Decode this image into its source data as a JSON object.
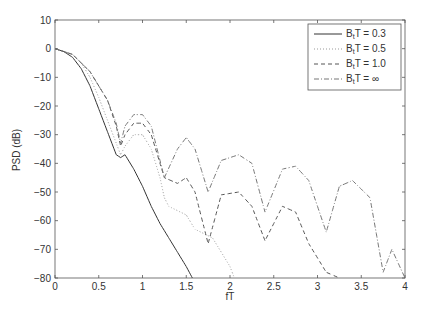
{
  "chart_data": {
    "type": "line",
    "title": "",
    "xlabel": "fT",
    "ylabel": "PSD (dB)",
    "xlim": [
      0,
      4
    ],
    "ylim": [
      -80,
      10
    ],
    "xticks": [
      "0",
      "0.5",
      "1",
      "1.5",
      "2",
      "2.5",
      "3",
      "3.5",
      "4"
    ],
    "yticks": [
      "10",
      "0",
      "-10",
      "-20",
      "-30",
      "-40",
      "-50",
      "-60",
      "-70",
      "-80"
    ],
    "grid": false,
    "legend_position": "upper right",
    "series": [
      {
        "name": "B_tT = 0.3",
        "style": "solid",
        "x": [
          0,
          0.1,
          0.2,
          0.3,
          0.4,
          0.5,
          0.6,
          0.7,
          0.75,
          0.8,
          0.9,
          1.0,
          1.1,
          1.2,
          1.3,
          1.4,
          1.5,
          1.57
        ],
        "y": [
          0,
          -1,
          -3,
          -7,
          -13,
          -21,
          -29,
          -37,
          -38,
          -37,
          -42,
          -48,
          -55,
          -61,
          -66,
          -71,
          -76,
          -80
        ]
      },
      {
        "name": "B_tT = 0.5",
        "style": "dotted",
        "x": [
          0,
          0.1,
          0.2,
          0.3,
          0.4,
          0.5,
          0.6,
          0.7,
          0.75,
          0.8,
          0.9,
          1.0,
          1.1,
          1.2,
          1.25,
          1.3,
          1.5,
          1.6,
          1.8,
          2.0,
          2.05
        ],
        "y": [
          0,
          -1,
          -2,
          -5,
          -10,
          -17,
          -25,
          -33,
          -37,
          -34,
          -30,
          -30,
          -35,
          -45,
          -52,
          -55,
          -58,
          -63,
          -66,
          -76,
          -80
        ]
      },
      {
        "name": "B_tT = 1.0",
        "style": "dashed",
        "x": [
          0,
          0.2,
          0.4,
          0.6,
          0.7,
          0.75,
          0.8,
          0.9,
          1.0,
          1.1,
          1.25,
          1.4,
          1.5,
          1.6,
          1.75,
          1.9,
          2.1,
          2.25,
          2.4,
          2.6,
          2.75,
          2.9,
          3.1,
          3.25
        ],
        "y": [
          0,
          -2,
          -8,
          -18,
          -27,
          -34,
          -30,
          -26,
          -26,
          -30,
          -45,
          -47,
          -45,
          -50,
          -68,
          -51,
          -50,
          -55,
          -67,
          -55,
          -57,
          -68,
          -78,
          -80
        ]
      },
      {
        "name": "B_tT = ∞",
        "style": "dashdot",
        "x": [
          0,
          0.2,
          0.4,
          0.6,
          0.7,
          0.75,
          0.8,
          0.9,
          1.0,
          1.1,
          1.25,
          1.4,
          1.5,
          1.6,
          1.75,
          1.9,
          2.1,
          2.25,
          2.4,
          2.6,
          2.75,
          2.9,
          3.1,
          3.25,
          3.4,
          3.6,
          3.75,
          3.85,
          4.0
        ],
        "y": [
          0,
          -2,
          -8,
          -18,
          -26,
          -33,
          -27,
          -23,
          -23,
          -27,
          -45,
          -35,
          -31,
          -35,
          -50,
          -39,
          -37,
          -40,
          -57,
          -42,
          -41,
          -46,
          -64,
          -48,
          -46,
          -52,
          -78,
          -70,
          -80
        ]
      }
    ]
  },
  "legend": {
    "entries": [
      {
        "label": "B",
        "sub": "t",
        "suffix": "T = 0.3"
      },
      {
        "label": "B",
        "sub": "t",
        "suffix": "T = 0.5"
      },
      {
        "label": "B",
        "sub": "t",
        "suffix": "T = 1.0"
      },
      {
        "label": "B",
        "sub": "t",
        "suffix": "T = ∞"
      }
    ]
  }
}
